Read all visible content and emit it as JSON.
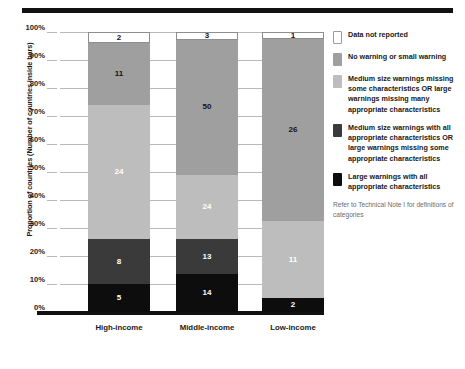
{
  "chart_data": {
    "type": "bar",
    "stacked": true,
    "title": "",
    "subtitle": "",
    "xlabel": "",
    "ylabel": "Proportion of countries (Number of countries inside bars)",
    "categories": [
      "High-income",
      "Middle-income",
      "Low-income"
    ],
    "ylim": [
      0,
      100
    ],
    "ytick_labels": [
      "0%",
      "10%",
      "20%",
      "30%",
      "40%",
      "50%",
      "60%",
      "70%",
      "80%",
      "90%",
      "100%"
    ],
    "ytick_values": [
      0,
      10,
      20,
      30,
      40,
      50,
      60,
      70,
      80,
      90,
      100
    ],
    "grid": true,
    "legend_position": "right",
    "value_units": "Number of countries",
    "series": [
      {
        "name": "Large warnings with all appropriate characteristics",
        "color": "#0d0d0d",
        "values": [
          5,
          14,
          2
        ],
        "percents": [
          10.0,
          13.5,
          5.0
        ],
        "label_color": "#ffffff"
      },
      {
        "name": "Medium size warnings with all appropriate characteristics OR large warnings missing some appropriate characteristics",
        "color": "#3a3a3a",
        "values": [
          8,
          13,
          0
        ],
        "percents": [
          16.0,
          12.5,
          0.0
        ],
        "label_color": "#ffffff"
      },
      {
        "name": "Medium size warnings missing some characteristics OR large warnings missing many appropriate characteristics",
        "color": "#bdbdbd",
        "values": [
          24,
          24,
          11
        ],
        "percents": [
          48.0,
          23.1,
          27.5
        ],
        "label_color": "#ffffff"
      },
      {
        "name": "No warning or small warning",
        "color": "#9f9f9f",
        "values": [
          11,
          50,
          26
        ],
        "percents": [
          22.0,
          48.1,
          65.0
        ],
        "label_color": "#141414"
      },
      {
        "name": "Data not reported",
        "color": "#ffffff",
        "values": [
          2,
          3,
          1
        ],
        "percents": [
          4.0,
          2.8,
          2.5
        ],
        "label_color": "#141414"
      }
    ],
    "annotations": [
      "Refer to Technical Note I for definitions of categories"
    ]
  },
  "axis": {
    "ylabel": "Proportion of countries (Number of countries inside bars)",
    "ticks": [
      {
        "label": "100%",
        "value": 100
      },
      {
        "label": "90%",
        "value": 90
      },
      {
        "label": "80%",
        "value": 80
      },
      {
        "label": "70%",
        "value": 70
      },
      {
        "label": "60%",
        "value": 60
      },
      {
        "label": "50%",
        "value": 50
      },
      {
        "label": "40%",
        "value": 40
      },
      {
        "label": "30%",
        "value": 30
      },
      {
        "label": "20%",
        "value": 20
      },
      {
        "label": "10%",
        "value": 10
      },
      {
        "label": "0%",
        "value": 0
      }
    ],
    "categories": [
      "High-income",
      "Middle-income",
      "Low-income"
    ]
  },
  "bars": [
    {
      "category": "High-income",
      "segments": [
        {
          "label": "5",
          "percent": 10.0,
          "style": "c-black",
          "text": "t-light"
        },
        {
          "label": "8",
          "percent": 16.0,
          "style": "c-darkgray",
          "text": "t-light"
        },
        {
          "label": "24",
          "percent": 48.0,
          "style": "c-lightgray",
          "text": "t-light"
        },
        {
          "label": "11",
          "percent": 22.0,
          "style": "c-midgray",
          "text": "t-dark"
        },
        {
          "label": "2",
          "percent": 4.0,
          "style": "c-white",
          "text": "t-dark"
        }
      ]
    },
    {
      "category": "Middle-income",
      "segments": [
        {
          "label": "14",
          "percent": 13.5,
          "style": "c-black",
          "text": "t-light"
        },
        {
          "label": "13",
          "percent": 12.5,
          "style": "c-darkgray",
          "text": "t-light"
        },
        {
          "label": "24",
          "percent": 23.1,
          "style": "c-lightgray",
          "text": "t-light"
        },
        {
          "label": "50",
          "percent": 48.1,
          "style": "c-midgray",
          "text": "t-dark"
        },
        {
          "label": "3",
          "percent": 2.8,
          "style": "c-white",
          "text": "t-dark"
        }
      ]
    },
    {
      "category": "Low-income",
      "segments": [
        {
          "label": "2",
          "percent": 5.0,
          "style": "c-black",
          "text": "t-light"
        },
        {
          "label": "11",
          "percent": 27.5,
          "style": "c-lightgray",
          "text": "t-light"
        },
        {
          "label": "26",
          "percent": 65.0,
          "style": "c-midgray",
          "text": "t-dark"
        },
        {
          "label": "1",
          "percent": 2.5,
          "style": "c-white",
          "text": "t-dark"
        }
      ]
    }
  ],
  "legend": {
    "items": [
      {
        "swatch": "sw-white",
        "text": "Data not reported"
      },
      {
        "swatch": "sw-midgray",
        "text": "No warning or small warning"
      },
      {
        "swatch": "sw-lightgray",
        "text": "Medium size warnings missing some characteristics OR large warnings missing many appropriate characteristics"
      },
      {
        "swatch": "sw-darkgray",
        "text": "Medium size warnings with all appropriate characteristics OR large warnings missing some appropriate characteristics"
      },
      {
        "swatch": "sw-black",
        "text": "Large warnings with all appropriate characteristics"
      }
    ],
    "footnote": "Refer to Technical Note I for definitions of categories"
  },
  "colors": {
    "data_not_reported": "#ffffff",
    "no_or_small_warning": "#9f9f9f",
    "medium_missing": "#bdbdbd",
    "medium_all": "#3a3a3a",
    "large_all": "#0d0d0d",
    "rule": "#111111",
    "grid": "#b9b9b9"
  }
}
